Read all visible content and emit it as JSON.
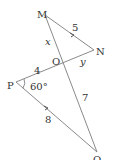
{
  "diagram": {
    "vertices": [
      {
        "name": "M",
        "label": "M",
        "x": 45,
        "y": 15
      },
      {
        "name": "N",
        "label": "N",
        "x": 94,
        "y": 50
      },
      {
        "name": "O",
        "label": "O",
        "x": 62,
        "y": 62
      },
      {
        "name": "P",
        "label": "P",
        "x": 16,
        "y": 82
      },
      {
        "name": "Q",
        "label": "Q",
        "x": 97,
        "y": 152
      }
    ],
    "segments": [
      {
        "from": "M",
        "to": "N",
        "label": "5"
      },
      {
        "from": "M",
        "to": "O",
        "label": "x"
      },
      {
        "from": "O",
        "to": "N",
        "label": "y"
      },
      {
        "from": "P",
        "to": "O",
        "label": "4"
      },
      {
        "from": "O",
        "to": "Q",
        "label": "7"
      },
      {
        "from": "P",
        "to": "Q",
        "label": "8"
      }
    ],
    "angle": {
      "at": "P",
      "label": "60°"
    },
    "parallel_marks": [
      "MN",
      "PQ"
    ]
  }
}
